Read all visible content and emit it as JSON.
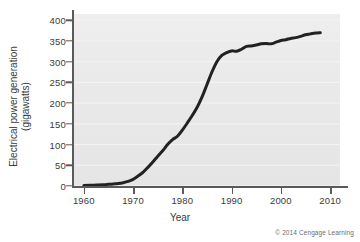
{
  "figure": {
    "credit": "© 2014 Cengage Learning",
    "background_color": "#ffffff",
    "panel_color": "#eaeaea",
    "line_color": "#222222",
    "axis_color": "#5a5a5a"
  },
  "chart_data": {
    "type": "line",
    "title": "",
    "xlabel": "Year",
    "ylabel": "Electrical power generation (gigawatts)",
    "ylabel_line1": "Electrical power generation",
    "ylabel_line2": "(gigawatts)",
    "xlim": [
      1958,
      2012
    ],
    "ylim": [
      0,
      415
    ],
    "xticks": [
      1960,
      1970,
      1980,
      1990,
      2000,
      2010
    ],
    "xtick_labels": [
      "1960",
      "1970",
      "1980",
      "1990",
      "2000",
      "2010"
    ],
    "yticks": [
      0,
      50,
      100,
      150,
      200,
      250,
      300,
      350,
      400
    ],
    "ytick_labels": [
      "0",
      "50",
      "100",
      "150",
      "200",
      "250",
      "300",
      "350",
      "400"
    ],
    "grid": true,
    "grid_axis": "y",
    "legend": false,
    "series": [
      {
        "name": "Electrical power generation",
        "color": "#222222",
        "x": [
          1960,
          1962,
          1964,
          1965,
          1966,
          1967,
          1968,
          1969,
          1970,
          1971,
          1972,
          1973,
          1974,
          1975,
          1976,
          1977,
          1978,
          1979,
          1980,
          1981,
          1982,
          1983,
          1984,
          1985,
          1986,
          1987,
          1988,
          1989,
          1990,
          1991,
          1992,
          1993,
          1994,
          1995,
          1996,
          1997,
          1998,
          1999,
          2000,
          2001,
          2002,
          2003,
          2004,
          2005,
          2006,
          2007,
          2008
        ],
        "y": [
          1,
          2,
          3,
          4,
          5,
          6,
          8,
          11,
          16,
          24,
          33,
          45,
          58,
          72,
          85,
          100,
          112,
          120,
          135,
          152,
          170,
          190,
          215,
          245,
          275,
          300,
          315,
          322,
          326,
          325,
          330,
          337,
          338,
          340,
          343,
          344,
          343,
          347,
          351,
          353,
          356,
          358,
          361,
          365,
          367,
          369,
          370
        ]
      }
    ]
  }
}
